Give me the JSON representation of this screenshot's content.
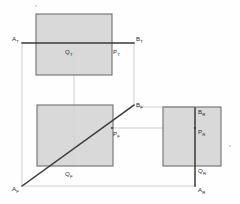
{
  "drawing": {
    "title": "Orthographic projection of line AB with points P and Q",
    "canvas": {
      "width": 240,
      "height": 204
    },
    "colors": {
      "face_fill": "#d6d6d6",
      "face_stroke": "#6f6f6f",
      "heavy_line": "#3a3a3a",
      "projection_line": "#b0b0b0",
      "paper": "#fefefe",
      "label_text": "#2b2b2b"
    },
    "views": [
      {
        "id": "top-view",
        "name": "Top view",
        "rect": {
          "x": 36,
          "y": 14,
          "width": 76,
          "height": 61
        }
      },
      {
        "id": "front-view",
        "name": "Front view",
        "rect": {
          "x": 37,
          "y": 105,
          "width": 76,
          "height": 61
        }
      },
      {
        "id": "right-view",
        "name": "Right side view",
        "rect": {
          "x": 163,
          "y": 107,
          "width": 58,
          "height": 59
        }
      }
    ],
    "heavy_lines": [
      {
        "id": "line-ab-top",
        "name": "line-AB-top-view",
        "x1": 22,
        "y1": 43,
        "x2": 134,
        "y2": 43
      },
      {
        "id": "line-ab-front",
        "name": "line-AB-front-view",
        "x1": 22,
        "y1": 186,
        "x2": 134,
        "y2": 105
      },
      {
        "id": "line-ab-right",
        "name": "line-AB-right-view",
        "x1": 195,
        "y1": 108,
        "x2": 195,
        "y2": 186
      }
    ],
    "projection_lines": [
      {
        "id": "proj-a-vertical",
        "name": "projector-A-top-to-front",
        "x1": 22,
        "y1": 44,
        "x2": 22,
        "y2": 186
      },
      {
        "id": "proj-q-vertical",
        "name": "projector-Q-top-to-front",
        "x1": 74,
        "y1": 44,
        "x2": 74,
        "y2": 166
      },
      {
        "id": "proj-b-vertical",
        "name": "projector-B-top-to-front",
        "x1": 134,
        "y1": 44,
        "x2": 134,
        "y2": 105
      },
      {
        "id": "proj-a-horizontal",
        "name": "projector-A-front-to-right",
        "x1": 23,
        "y1": 186,
        "x2": 196,
        "y2": 186
      },
      {
        "id": "proj-b-horizontal",
        "name": "projector-B-front-to-right",
        "x1": 136,
        "y1": 107,
        "x2": 194,
        "y2": 107
      },
      {
        "id": "proj-p-horizontal",
        "name": "projector-P-front-to-right",
        "x1": 112,
        "y1": 128,
        "x2": 194,
        "y2": 128
      },
      {
        "id": "proj-pt-horizontal",
        "name": "projector-P-top-extension",
        "x1": 112,
        "y1": 43,
        "x2": 112,
        "y2": 43
      }
    ],
    "points": [
      {
        "id": "at",
        "letter": "A",
        "sub": "T",
        "name": "point-A-top",
        "x": 22,
        "y": 43,
        "lx": 12,
        "ly": 41
      },
      {
        "id": "qt",
        "letter": "Q",
        "sub": "T",
        "name": "point-Q-top",
        "x": 74,
        "y": 43,
        "lx": 65,
        "ly": 54
      },
      {
        "id": "pt",
        "letter": "P",
        "sub": "T",
        "name": "point-P-top",
        "x": 112,
        "y": 43,
        "lx": 113,
        "ly": 54
      },
      {
        "id": "bt",
        "letter": "B",
        "sub": "T",
        "name": "point-B-top",
        "x": 134,
        "y": 43,
        "lx": 136,
        "ly": 41
      },
      {
        "id": "af",
        "letter": "A",
        "sub": "F",
        "name": "point-A-front",
        "x": 22,
        "y": 186,
        "lx": 12,
        "ly": 191
      },
      {
        "id": "qf",
        "letter": "Q",
        "sub": "F",
        "name": "point-Q-front",
        "x": 74,
        "y": 166,
        "lx": 65,
        "ly": 176
      },
      {
        "id": "pf",
        "letter": "P",
        "sub": "F",
        "name": "point-P-front",
        "x": 112,
        "y": 128,
        "lx": 113,
        "ly": 136
      },
      {
        "id": "bf",
        "letter": "B",
        "sub": "F",
        "name": "point-B-front",
        "x": 134,
        "y": 105,
        "lx": 136,
        "ly": 107
      },
      {
        "id": "br",
        "letter": "B",
        "sub": "R",
        "name": "point-B-right",
        "x": 195,
        "y": 108,
        "lx": 198,
        "ly": 114
      },
      {
        "id": "pr",
        "letter": "P",
        "sub": "R",
        "name": "point-P-right",
        "x": 195,
        "y": 128,
        "lx": 198,
        "ly": 134
      },
      {
        "id": "qr",
        "letter": "Q",
        "sub": "R",
        "name": "point-Q-right",
        "x": 195,
        "y": 166,
        "lx": 198,
        "ly": 173
      },
      {
        "id": "ar",
        "letter": "A",
        "sub": "R",
        "name": "point-A-right",
        "x": 195,
        "y": 186,
        "lx": 198,
        "ly": 192
      }
    ],
    "specks": [
      {
        "id": "speck-top",
        "name": "paper-speck-top",
        "x": 36,
        "y": 6,
        "r": 0.9
      },
      {
        "id": "speck-right",
        "name": "paper-speck-right",
        "x": 230,
        "y": 146,
        "r": 0.9
      }
    ]
  }
}
